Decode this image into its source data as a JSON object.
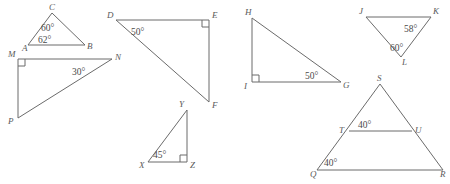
{
  "page": {
    "background_color": "#ffffff",
    "stroke_color": "#6b6b6b",
    "label_color": "#5a5a5a",
    "width": 450,
    "height": 184
  },
  "figures": [
    {
      "id": "triangle-abc",
      "name": "Triangle ABC",
      "vertices": [
        {
          "label": "A",
          "x": 28,
          "y": 45
        },
        {
          "label": "B",
          "x": 85,
          "y": 45
        },
        {
          "label": "C",
          "x": 52,
          "y": 13
        }
      ],
      "angles": [
        {
          "label": "60°",
          "at": "C",
          "x": 50,
          "y": 28
        },
        {
          "label": "62°",
          "at": "A",
          "x": 48,
          "y": 40
        }
      ],
      "right_angles": []
    },
    {
      "id": "triangle-mnp",
      "name": "Triangle MNP",
      "vertices": [
        {
          "label": "M",
          "x": 18,
          "y": 59
        },
        {
          "label": "N",
          "x": 112,
          "y": 59
        },
        {
          "label": "P",
          "x": 18,
          "y": 118
        }
      ],
      "angles": [
        {
          "label": "30°",
          "at": "N",
          "x": 82,
          "y": 72
        }
      ],
      "right_angles": [
        {
          "at": "M"
        }
      ]
    },
    {
      "id": "triangle-def",
      "name": "Triangle DEF",
      "vertices": [
        {
          "label": "D",
          "x": 116,
          "y": 20
        },
        {
          "label": "E",
          "x": 209,
          "y": 20
        },
        {
          "label": "F",
          "x": 209,
          "y": 102
        }
      ],
      "angles": [
        {
          "label": "50°",
          "at": "D",
          "x": 140,
          "y": 32
        }
      ],
      "right_angles": [
        {
          "at": "E"
        }
      ]
    },
    {
      "id": "triangle-xyz",
      "name": "Triangle XYZ",
      "vertices": [
        {
          "label": "X",
          "x": 148,
          "y": 162
        },
        {
          "label": "Y",
          "x": 187,
          "y": 110
        },
        {
          "label": "Z",
          "x": 187,
          "y": 162
        }
      ],
      "angles": [
        {
          "label": "45°",
          "at": "X",
          "x": 160,
          "y": 155
        }
      ],
      "right_angles": [
        {
          "at": "Z"
        }
      ]
    },
    {
      "id": "triangle-hig",
      "name": "Triangle HIG",
      "vertices": [
        {
          "label": "H",
          "x": 252,
          "y": 18
        },
        {
          "label": "I",
          "x": 252,
          "y": 82
        },
        {
          "label": "G",
          "x": 341,
          "y": 82
        }
      ],
      "angles": [
        {
          "label": "50°",
          "at": "G",
          "x": 313,
          "y": 75
        }
      ],
      "right_angles": [
        {
          "at": "I"
        }
      ]
    },
    {
      "id": "triangle-jkl",
      "name": "Triangle JKL",
      "vertices": [
        {
          "label": "J",
          "x": 366,
          "y": 17
        },
        {
          "label": "K",
          "x": 431,
          "y": 17
        },
        {
          "label": "L",
          "x": 401,
          "y": 57
        }
      ],
      "angles": [
        {
          "label": "58°",
          "at": "K",
          "x": 411,
          "y": 29
        },
        {
          "label": "60°",
          "at": "L",
          "x": 399,
          "y": 49
        }
      ],
      "right_angles": []
    },
    {
      "id": "triangle-qrs",
      "name": "Triangle QRS with segment TU",
      "vertices": [
        {
          "label": "S",
          "x": 380,
          "y": 84
        },
        {
          "label": "T",
          "x": 349,
          "y": 131
        },
        {
          "label": "U",
          "x": 412,
          "y": 131
        },
        {
          "label": "Q",
          "x": 317,
          "y": 170
        },
        {
          "label": "R",
          "x": 443,
          "y": 170
        }
      ],
      "angles": [
        {
          "label": "40°",
          "at": "T",
          "x": 366,
          "y": 126
        },
        {
          "label": "40°",
          "at": "Q",
          "x": 330,
          "y": 163
        }
      ],
      "right_angles": [],
      "segment": {
        "from": "T",
        "to": "U",
        "name": "midsegment-tu"
      }
    }
  ]
}
